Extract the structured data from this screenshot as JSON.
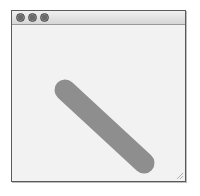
{
  "window": {
    "buttons": [
      {
        "name": "close",
        "icon": "close-circle-icon"
      },
      {
        "name": "minimize",
        "icon": "minimize-circle-icon"
      },
      {
        "name": "maximize",
        "icon": "maximize-circle-icon"
      }
    ]
  },
  "content": {
    "shape": {
      "type": "line",
      "x1": 53,
      "y1": 65,
      "x2": 132,
      "y2": 138,
      "stroke_width": 21,
      "line_cap": "round",
      "color": "#8e8e8e"
    }
  },
  "colors": {
    "frame": "#5a5a5a",
    "background": "#f2f2f2",
    "shape": "#8e8e8e"
  }
}
